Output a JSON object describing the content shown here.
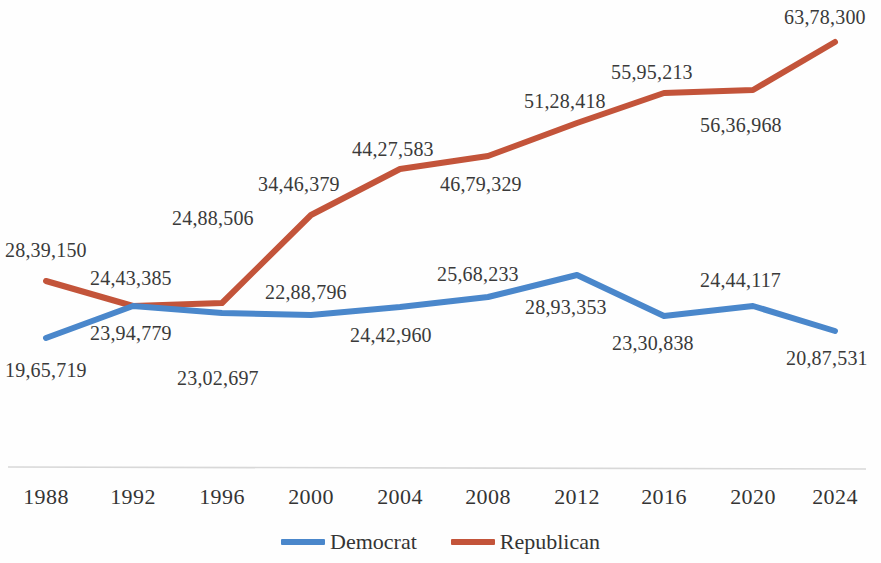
{
  "chart_data": {
    "type": "line",
    "title": "",
    "xlabel": "",
    "ylabel": "",
    "grid": false,
    "legend_position": "bottom-center",
    "categories": [
      "1988",
      "1992",
      "1996",
      "2000",
      "2004",
      "2008",
      "2012",
      "2016",
      "2020",
      "2024"
    ],
    "x_tick_labels": [
      "1988",
      "1992",
      "1996",
      "2000",
      "2004",
      "2008",
      "2012",
      "2016",
      "2020",
      "2024"
    ],
    "y_axis_visible": false,
    "series": [
      {
        "name": "Democrat",
        "color": "#4A87CB",
        "values": [
          1965719,
          2394779,
          2302697,
          2288796,
          2442960,
          2568233,
          2893353,
          2330838,
          2444117,
          2087531
        ],
        "value_labels": [
          "19,65,719",
          "23,94,779",
          "23,02,697",
          "22,88,796",
          "24,42,960",
          "25,68,233",
          "28,93,353",
          "23,30,838",
          "24,44,117",
          "20,87,531"
        ]
      },
      {
        "name": "Republican",
        "color": "#C3543A",
        "values": [
          2839150,
          2443385,
          2488506,
          3446379,
          4427583,
          4679329,
          5128418,
          5595213,
          5636968,
          6378300
        ],
        "value_labels": [
          "28,39,150",
          "24,43,385",
          "24,88,506",
          "34,46,379",
          "44,27,583",
          "46,79,329",
          "51,28,418",
          "55,95,213",
          "56,36,968",
          "63,78,300"
        ]
      }
    ]
  },
  "legend": {
    "items": [
      {
        "label": "Democrat",
        "color": "#4A87CB"
      },
      {
        "label": "Republican",
        "color": "#C3543A"
      }
    ]
  },
  "geometry": {
    "axis_line_color": "#d8d8d8",
    "democrat_points": [
      {
        "x": 46,
        "y": 338
      },
      {
        "x": 133,
        "y": 306
      },
      {
        "x": 222,
        "y": 313
      },
      {
        "x": 311,
        "y": 315
      },
      {
        "x": 400,
        "y": 307
      },
      {
        "x": 488,
        "y": 297
      },
      {
        "x": 577,
        "y": 275
      },
      {
        "x": 664,
        "y": 316
      },
      {
        "x": 753,
        "y": 306
      },
      {
        "x": 835,
        "y": 331
      }
    ],
    "republican_points": [
      {
        "x": 46,
        "y": 281
      },
      {
        "x": 133,
        "y": 306
      },
      {
        "x": 222,
        "y": 303
      },
      {
        "x": 311,
        "y": 215
      },
      {
        "x": 400,
        "y": 169
      },
      {
        "x": 488,
        "y": 156
      },
      {
        "x": 577,
        "y": 123
      },
      {
        "x": 664,
        "y": 93
      },
      {
        "x": 753,
        "y": 90
      },
      {
        "x": 835,
        "y": 42
      }
    ],
    "democrat_label_pos": [
      {
        "x": 5,
        "y": 360
      },
      {
        "x": 90,
        "y": 323
      },
      {
        "x": 177,
        "y": 368
      },
      {
        "x": 265,
        "y": 282
      },
      {
        "x": 350,
        "y": 325
      },
      {
        "x": 437,
        "y": 264
      },
      {
        "x": 525,
        "y": 297
      },
      {
        "x": 612,
        "y": 333
      },
      {
        "x": 700,
        "y": 270
      },
      {
        "x": 786,
        "y": 348
      }
    ],
    "republican_label_pos": [
      {
        "x": 5,
        "y": 240
      },
      {
        "x": 90,
        "y": 268
      },
      {
        "x": 172,
        "y": 208
      },
      {
        "x": 258,
        "y": 174
      },
      {
        "x": 352,
        "y": 139
      },
      {
        "x": 440,
        "y": 174
      },
      {
        "x": 524,
        "y": 91
      },
      {
        "x": 611,
        "y": 62
      },
      {
        "x": 700,
        "y": 115
      },
      {
        "x": 784,
        "y": 7
      }
    ],
    "tick_positions_x": [
      46,
      133,
      222,
      311,
      400,
      488,
      577,
      664,
      753,
      835
    ],
    "tick_label_y": 484,
    "axis_y": 467
  }
}
